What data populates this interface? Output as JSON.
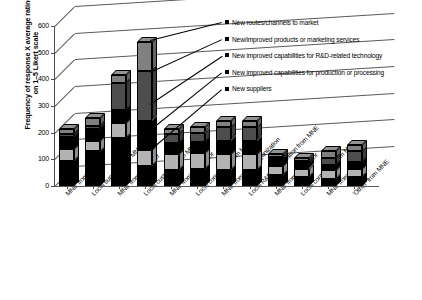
{
  "chart_data": {
    "type": "bar",
    "subtype": "stacked-column-3d",
    "title": "",
    "xlabel": "",
    "ylabel": "Frequency of response X average rating on 1–5 Likert scale",
    "ylim": [
      0,
      600
    ],
    "yticks": [
      0,
      100,
      200,
      300,
      400,
      500,
      600
    ],
    "grid": true,
    "legend_position": "top-right",
    "categories": [
      "MNE from supplier",
      "Local supplier from MNE",
      "MNE from customer",
      "Local customer from MNE",
      "MNE from competitor",
      "Local competitor from MNE",
      "MNE from R&D organization",
      "Local R&D organization from MNE",
      "MNE from contractor",
      "Local contractor from MNE",
      "MNE from 'other'",
      "'Other' from MNE"
    ],
    "series": [
      {
        "name": "New suppliers",
        "color": "#000000",
        "values": [
          95,
          130,
          180,
          75,
          60,
          65,
          60,
          60,
          40,
          35,
          25,
          35
        ]
      },
      {
        "name": "New improved capabilities for production or processing",
        "color": "#b3b3b3",
        "values": [
          45,
          40,
          55,
          60,
          60,
          60,
          60,
          60,
          35,
          30,
          35,
          30
        ]
      },
      {
        "name": "New improved capabilities for R&D-related technology",
        "color": "#000000",
        "values": [
          45,
          45,
          50,
          110,
          40,
          40,
          50,
          50,
          25,
          20,
          20,
          25
        ]
      },
      {
        "name": "New/improved products or marketing services",
        "color": "#4d4d4d",
        "values": [
          10,
          10,
          100,
          185,
          35,
          35,
          50,
          50,
          10,
          10,
          25,
          40
        ]
      },
      {
        "name": "New routes/channels to market",
        "color": "#808080",
        "values": [
          20,
          30,
          30,
          110,
          20,
          20,
          25,
          25,
          10,
          10,
          25,
          25
        ]
      }
    ],
    "totals": [
      215,
      255,
      415,
      540,
      215,
      220,
      245,
      245,
      120,
      105,
      130,
      155
    ]
  },
  "legend": {
    "items": [
      "New routes/channels to market",
      "New/improved products or marketing services",
      "New improved capabilities for R&D-related technology",
      "New improved capabilities for production or processing",
      "New suppliers"
    ]
  },
  "axis": {
    "y_title_line1": "Frequency of response X average rating",
    "y_title_line2": "on 1–5 Likert scale"
  },
  "icons": {
    "legend_swatch": "square-swatch-icon"
  }
}
